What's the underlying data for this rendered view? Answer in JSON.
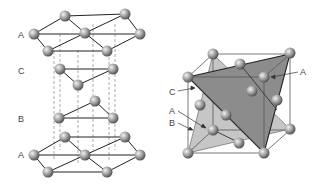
{
  "figures": [
    {
      "id": "hcp-stacking",
      "title": "",
      "layer_labels": [
        "A",
        "C",
        "B",
        "A"
      ]
    },
    {
      "id": "fcc-cube",
      "title": "",
      "labels": {
        "A_top": "A",
        "C": "C",
        "A_bottom": "A",
        "B": "B"
      }
    }
  ],
  "colors": {
    "atom_light": "#e8e8e8",
    "atom_dark": "#5a5a5a",
    "plane_dark": "#8a8a8a",
    "plane_light": "#c4c4c4",
    "edge": "#222222"
  }
}
